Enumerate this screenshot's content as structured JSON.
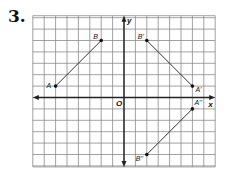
{
  "problem": {
    "number": "3."
  },
  "grid": {
    "x_min": -8,
    "x_max": 8,
    "y_min": -6,
    "y_max": 7,
    "line_color": "#8a8a8a",
    "axis_color": "#222222"
  },
  "axes": {
    "x_label": "x",
    "y_label": "y",
    "origin_label": "O"
  },
  "points": [
    {
      "name": "A",
      "label": "A",
      "x": -6,
      "y": 1
    },
    {
      "name": "B",
      "label": "B",
      "x": -2,
      "y": 5
    },
    {
      "name": "A-prime",
      "label": "A'",
      "x": 6,
      "y": 1
    },
    {
      "name": "B-prime",
      "label": "B'",
      "x": 2,
      "y": 5
    },
    {
      "name": "A-double-prime",
      "label": "A''",
      "x": 6,
      "y": -1
    },
    {
      "name": "B-double-prime",
      "label": "B''",
      "x": 2,
      "y": -5
    }
  ],
  "segments": [
    {
      "name": "segment-AB",
      "from": "A",
      "to": "B"
    },
    {
      "name": "segment-A'B'",
      "from": "A'",
      "to": "B'"
    },
    {
      "name": "segment-A''B''",
      "from": "A''",
      "to": "B''"
    }
  ]
}
